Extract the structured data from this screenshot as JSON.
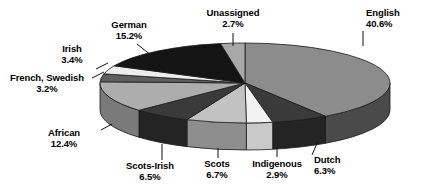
{
  "chart_data": {
    "type": "pie",
    "title": "",
    "subtitle": "",
    "xlabel": "",
    "ylabel": "",
    "legend_position": "none",
    "grid": false,
    "three_d": true,
    "units": "percent",
    "start_angle_deg": 0,
    "direction": "clockwise",
    "categories": [
      "English",
      "Dutch",
      "Indigenous",
      "Scots",
      "Scots-Irish",
      "African",
      "French, Swedish",
      "Irish",
      "German",
      "Unassigned"
    ],
    "values": [
      40.6,
      6.3,
      2.9,
      6.7,
      6.5,
      12.4,
      3.2,
      3.4,
      15.2,
      2.7
    ],
    "slices": [
      {
        "label": "English",
        "value": 40.6,
        "value_text": "40.6%",
        "color": "#8c8c8c",
        "side_color": "#4a4a4a"
      },
      {
        "label": "Dutch",
        "value": 6.3,
        "value_text": "6.3%",
        "color": "#3a3a3a",
        "side_color": "#242424"
      },
      {
        "label": "Indigenous",
        "value": 2.9,
        "value_text": "2.9%",
        "color": "#f2f2f2",
        "side_color": "#c9c9c9"
      },
      {
        "label": "Scots",
        "value": 6.7,
        "value_text": "6.7%",
        "color": "#c2c2c2",
        "side_color": "#8e8e8e"
      },
      {
        "label": "Scots-Irish",
        "value": 6.5,
        "value_text": "6.5%",
        "color": "#3a3a3a",
        "side_color": "#242424"
      },
      {
        "label": "African",
        "value": 12.4,
        "value_text": "12.4%",
        "color": "#adadad",
        "side_color": "#7a7a7a"
      },
      {
        "label": "French, Swedish",
        "value": 3.2,
        "value_text": "3.2%",
        "color": "#5e5e5e",
        "side_color": "#3c3c3c"
      },
      {
        "label": "Irish",
        "value": 3.4,
        "value_text": "3.4%",
        "color": "#ededed",
        "side_color": "#bdbdbd"
      },
      {
        "label": "German",
        "value": 15.2,
        "value_text": "15.2%",
        "color": "#141414",
        "side_color": "#0b0b0b"
      },
      {
        "label": "Unassigned",
        "value": 2.7,
        "value_text": "2.7%",
        "color": "#a8a8a8",
        "side_color": "#767676"
      }
    ],
    "total": 100.0
  },
  "labels": {
    "unassigned": {
      "name": "Unassigned",
      "pct": "2.7%"
    },
    "english": {
      "name": "English",
      "pct": "40.6%"
    },
    "dutch": {
      "name": "Dutch",
      "pct": "6.3%"
    },
    "indigenous": {
      "name": "Indigenous",
      "pct": "2.9%"
    },
    "scots": {
      "name": "Scots",
      "pct": "6.7%"
    },
    "scots_irish": {
      "name": "Scots-Irish",
      "pct": "6.5%"
    },
    "african": {
      "name": "African",
      "pct": "12.4%"
    },
    "french_swedish": {
      "name": "French, Swedish",
      "pct": "3.2%"
    },
    "irish": {
      "name": "Irish",
      "pct": "3.4%"
    },
    "german": {
      "name": "German",
      "pct": "15.2%"
    }
  },
  "style": {
    "background": "#ffffff",
    "text_color": "#000000",
    "leader_color": "#111111",
    "outline_color": "#1a1a1a"
  }
}
